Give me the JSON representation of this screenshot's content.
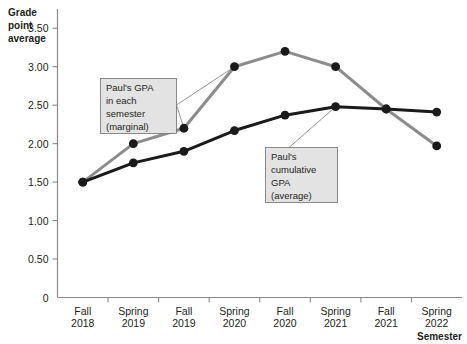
{
  "chart_data": {
    "type": "line",
    "title": "",
    "ylabel": "Grade point average",
    "xlabel": "Semester",
    "categories": [
      "Fall 2018",
      "Spring 2019",
      "Fall 2019",
      "Spring 2020",
      "Fall 2020",
      "Spring 2021",
      "Fall 2021",
      "Spring 2022"
    ],
    "category_lines": [
      {
        "top": "Fall",
        "bottom": "2018"
      },
      {
        "top": "Spring",
        "bottom": "2019"
      },
      {
        "top": "Fall",
        "bottom": "2019"
      },
      {
        "top": "Spring",
        "bottom": "2020"
      },
      {
        "top": "Fall",
        "bottom": "2020"
      },
      {
        "top": "Spring",
        "bottom": "2021"
      },
      {
        "top": "Fall",
        "bottom": "2021"
      },
      {
        "top": "Spring",
        "bottom": "2022"
      }
    ],
    "ylim": [
      0,
      3.75
    ],
    "yticks": [
      0,
      0.5,
      1.0,
      1.5,
      2.0,
      2.5,
      3.0,
      3.5
    ],
    "ytick_labels": [
      "0",
      "0.50",
      "1.00",
      "1.50",
      "2.00",
      "2.50",
      "3.00",
      "3.50"
    ],
    "grid": false,
    "legend": "none",
    "series": [
      {
        "name": "Paul's GPA in each semester (marginal)",
        "color": "#8c8c8c",
        "marker_color": "#1a1a1a",
        "values": [
          1.5,
          2.0,
          2.2,
          3.0,
          3.2,
          3.0,
          2.45,
          1.97
        ]
      },
      {
        "name": "Paul's cumulative GPA (average)",
        "color": "#1a1a1a",
        "marker_color": "#1a1a1a",
        "values": [
          1.5,
          1.75,
          1.9,
          2.17,
          2.37,
          2.48,
          2.45,
          2.41
        ]
      }
    ],
    "annotations": [
      {
        "id": "marginal",
        "lines": [
          "Paul's GPA",
          "in each",
          "semester",
          "(marginal)"
        ],
        "target_index": 2
      },
      {
        "id": "cumulative",
        "lines": [
          "Paul's",
          "cumulative",
          "GPA",
          "(average)"
        ],
        "target_index": 5
      }
    ]
  },
  "axes": {
    "y_title_lines": [
      "Grade",
      "point",
      "average"
    ],
    "x_title": "Semester"
  },
  "colors": {
    "marginal": "#8c8c8c",
    "cumulative": "#1a1a1a",
    "axis": "#8a8a8a",
    "callout_fill": "#e3e3e3",
    "callout_border": "#6f6f6f",
    "background": "#ffffff"
  }
}
